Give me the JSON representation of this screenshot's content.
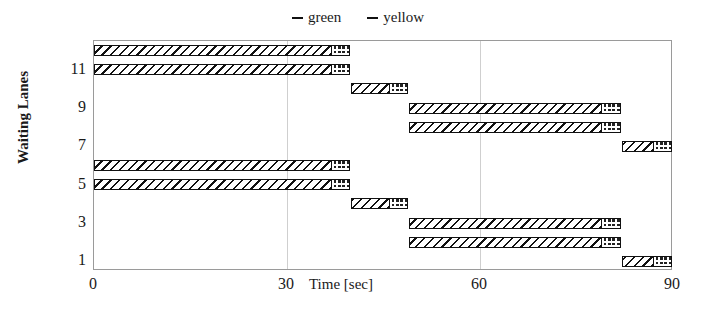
{
  "chart_data": {
    "type": "bar",
    "title": "",
    "xlabel": "Time [sec]",
    "ylabel": "Waiting Lanes",
    "xlim": [
      0,
      90
    ],
    "ylim": [
      0.5,
      12.5
    ],
    "xticks": [
      "0",
      "30",
      "60",
      "90"
    ],
    "xtick_values": [
      0,
      30,
      60,
      90
    ],
    "yticks": [
      "11",
      "9",
      "7",
      "5",
      "3",
      "1"
    ],
    "ytick_values": [
      11,
      9,
      7,
      5,
      3,
      1
    ],
    "grid": "vertical",
    "legend_position": "top-center",
    "legend": [
      {
        "name": "green",
        "pattern": "diagonal-hatch"
      },
      {
        "name": "yellow",
        "pattern": "checker-hatch"
      }
    ],
    "series": [
      {
        "name": "green",
        "pattern": "diagonal-hatch"
      },
      {
        "name": "yellow",
        "pattern": "checker-hatch"
      }
    ],
    "lanes": [
      {
        "lane": 12,
        "green_start": 0,
        "green_end": 37,
        "yellow_start": 37,
        "yellow_end": 40
      },
      {
        "lane": 11,
        "green_start": 0,
        "green_end": 37,
        "yellow_start": 37,
        "yellow_end": 40
      },
      {
        "lane": 10,
        "green_start": 40,
        "green_end": 46,
        "yellow_start": 46,
        "yellow_end": 49
      },
      {
        "lane": 9,
        "green_start": 49,
        "green_end": 79,
        "yellow_start": 79,
        "yellow_end": 82
      },
      {
        "lane": 8,
        "green_start": 49,
        "green_end": 79,
        "yellow_start": 79,
        "yellow_end": 82
      },
      {
        "lane": 7,
        "green_start": 82,
        "green_end": 87,
        "yellow_start": 87,
        "yellow_end": 90
      },
      {
        "lane": 6,
        "green_start": 0,
        "green_end": 37,
        "yellow_start": 37,
        "yellow_end": 40
      },
      {
        "lane": 5,
        "green_start": 0,
        "green_end": 37,
        "yellow_start": 37,
        "yellow_end": 40
      },
      {
        "lane": 4,
        "green_start": 40,
        "green_end": 46,
        "yellow_start": 46,
        "yellow_end": 49
      },
      {
        "lane": 3,
        "green_start": 49,
        "green_end": 79,
        "yellow_start": 79,
        "yellow_end": 82
      },
      {
        "lane": 2,
        "green_start": 49,
        "green_end": 79,
        "yellow_start": 79,
        "yellow_end": 82
      },
      {
        "lane": 1,
        "green_start": 82,
        "green_end": 87,
        "yellow_start": 87,
        "yellow_end": 90
      }
    ]
  },
  "colors": {
    "axis": "#9a9a9a",
    "grid": "#cfcfcf",
    "ink": "#111111",
    "background": "#ffffff"
  }
}
